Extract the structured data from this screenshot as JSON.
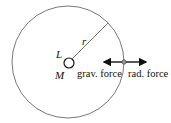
{
  "diagram": {
    "labels": {
      "luminosity": "L",
      "mass": "M",
      "radius": "r",
      "grav_force": "grav. force",
      "rad_force": "rad. force"
    },
    "colors": {
      "stroke": "#555555",
      "text": "#111111"
    }
  }
}
